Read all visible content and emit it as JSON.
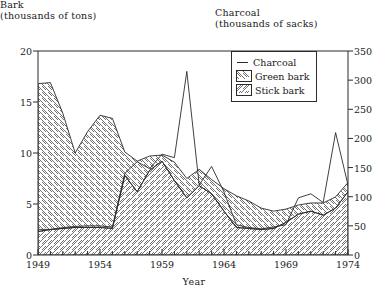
{
  "chart_data": {
    "type": "area",
    "title": "",
    "left_axis": {
      "label_line1": "Bark",
      "label_line2": "(thousands of tons)",
      "ticks": [
        0,
        5,
        10,
        15,
        20
      ],
      "ylim": [
        0,
        20
      ]
    },
    "right_axis": {
      "label_line1": "Charcoal",
      "label_line2": "(thousands of sacks)",
      "ticks": [
        0,
        50,
        100,
        150,
        200,
        250,
        300,
        350
      ],
      "ylim": [
        0,
        350
      ]
    },
    "xlabel": "Year",
    "xlim": [
      1949,
      1974
    ],
    "xticks": [
      1949,
      1954,
      1959,
      1964,
      1969,
      1974
    ],
    "x_minor_tick_step": 1,
    "grid": false,
    "legend": {
      "position": "top-right-inside",
      "entries": [
        {
          "name": "Charcoal",
          "marker": "line"
        },
        {
          "name": "Green bark",
          "marker": "hatch-backslash"
        },
        {
          "name": "Stick bark",
          "marker": "hatch-slash"
        }
      ]
    },
    "x": [
      1949,
      1950,
      1951,
      1952,
      1953,
      1954,
      1955,
      1956,
      1957,
      1958,
      1959,
      1960,
      1961,
      1962,
      1963,
      1964,
      1965,
      1966,
      1967,
      1968,
      1969,
      1970,
      1971,
      1972,
      1973,
      1974
    ],
    "series": [
      {
        "name": "Stick bark",
        "axis": "left",
        "units": "thousands of tons",
        "stack": "bark",
        "stack_order": 1,
        "fill": "hatch-slash",
        "values": [
          2.3,
          2.5,
          2.6,
          2.7,
          2.7,
          2.7,
          2.6,
          7.8,
          6.2,
          8.3,
          9.2,
          7.3,
          5.6,
          6.8,
          6.0,
          4.3,
          2.7,
          2.6,
          2.5,
          2.6,
          3.2,
          4.0,
          4.3,
          3.9,
          4.6,
          6.2
        ]
      },
      {
        "name": "Green bark",
        "axis": "left",
        "units": "thousands of tons",
        "stack": "bark",
        "stack_order": 2,
        "fill": "hatch-backslash",
        "values": [
          14.5,
          14.4,
          11.3,
          7.3,
          9.4,
          11.0,
          10.8,
          2.3,
          3.0,
          1.4,
          0.6,
          1.8,
          1.9,
          1.6,
          1.4,
          2.2,
          3.1,
          2.7,
          2.1,
          1.7,
          1.3,
          0.9,
          0.8,
          1.2,
          1.1,
          0.9
        ]
      },
      {
        "name": "Bark total",
        "axis": "left",
        "units": "thousands of tons",
        "derived": true,
        "values": [
          16.8,
          16.9,
          13.9,
          10.0,
          12.1,
          13.7,
          13.4,
          10.1,
          9.2,
          9.7,
          9.8,
          9.1,
          7.5,
          8.4,
          7.4,
          6.5,
          5.8,
          5.3,
          4.6,
          4.3,
          4.5,
          4.9,
          5.1,
          5.1,
          5.7,
          7.1
        ]
      },
      {
        "name": "Charcoal",
        "axis": "right",
        "units": "thousands of sacks",
        "type": "line",
        "values": [
          44,
          44,
          47,
          49,
          50,
          50,
          48,
          140,
          160,
          148,
          173,
          167,
          315,
          120,
          152,
          108,
          52,
          47,
          45,
          48,
          52,
          98,
          105,
          90,
          210,
          120
        ]
      }
    ]
  }
}
